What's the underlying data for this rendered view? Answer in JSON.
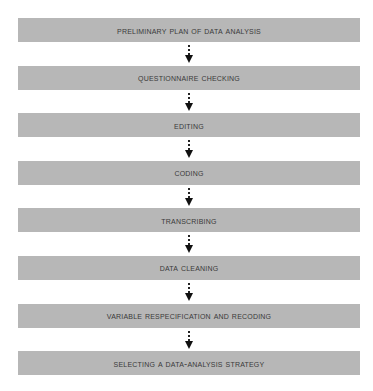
{
  "diagram": {
    "type": "vertical-flowchart",
    "colors": {
      "box_fill": "#b7b7b7",
      "text": "#3a3a3a",
      "arrow": "#111111",
      "background": "#ffffff"
    },
    "steps": [
      {
        "label": "Preliminary Plan of Data Analysis"
      },
      {
        "label": "Questionnaire Checking"
      },
      {
        "label": "Editing"
      },
      {
        "label": "Coding"
      },
      {
        "label": "Transcribing"
      },
      {
        "label": "Data Cleaning"
      },
      {
        "label": "Variable Respecification and Recoding"
      },
      {
        "label": "Selecting a Data-Analysis Strategy"
      }
    ],
    "connector_style": "dotted-arrow-down"
  }
}
